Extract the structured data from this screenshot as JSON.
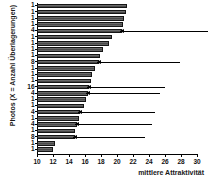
{
  "chart_data": {
    "type": "bar",
    "orientation": "horizontal",
    "title": "",
    "xlabel": "mittlere Attraktivität",
    "ylabel": "Photos (X = Anzahl Überlagerungen)",
    "xlim": [
      10,
      30
    ],
    "ylim_note": "24 photo categories, sorted descending by mean attractiveness",
    "grid": false,
    "legend": null,
    "xticks": [
      10,
      12,
      14,
      16,
      18,
      20,
      22,
      24,
      26,
      28,
      30
    ],
    "xticklabels": [
      "10",
      "12",
      "14",
      "16",
      "18",
      "20",
      "22",
      "24",
      "26",
      "28",
      "30"
    ],
    "categories": [
      "1",
      "1",
      "1",
      "1",
      "4",
      "1",
      "1",
      "1",
      "1",
      "8",
      "1",
      "1",
      "1",
      "16",
      "4",
      "1",
      "1",
      "4",
      "1",
      "4",
      "1",
      "8",
      "1",
      "1"
    ],
    "values": [
      21.2,
      21.1,
      20.9,
      20.7,
      20.6,
      19.4,
      19.0,
      18.3,
      17.9,
      17.8,
      17.3,
      16.9,
      16.7,
      16.5,
      16.4,
      16.1,
      15.9,
      15.4,
      15.2,
      15.0,
      14.8,
      14.7,
      12.2,
      12.0
    ],
    "bar_color": "#575757",
    "bar_edge_color": "#151515",
    "annotations": [
      {
        "type": "arrow",
        "points_to_row": 4,
        "label": "",
        "category": "4"
      },
      {
        "type": "arrow",
        "points_to_row": 9,
        "label": "",
        "category": "8"
      },
      {
        "type": "arrow",
        "points_to_row": 13,
        "label": "",
        "category": "16"
      },
      {
        "type": "arrow",
        "points_to_row": 14,
        "label": "",
        "category": "4"
      },
      {
        "type": "arrow",
        "points_to_row": 17,
        "label": "",
        "category": "4"
      },
      {
        "type": "arrow",
        "points_to_row": 19,
        "label": "",
        "category": "4"
      },
      {
        "type": "arrow",
        "points_to_row": 21,
        "label": "",
        "category": "8"
      }
    ]
  }
}
